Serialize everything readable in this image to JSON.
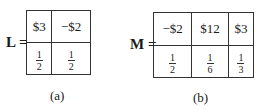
{
  "figure_a": {
    "label": "L =",
    "row1": [
      "$3",
      "−$2"
    ],
    "row2": [
      {
        "num": "1",
        "den": "2"
      },
      {
        "num": "1",
        "den": "2"
      }
    ],
    "caption": "(a)"
  },
  "figure_b": {
    "label": "M =",
    "row1": [
      "−$2",
      "$12",
      "$3"
    ],
    "row2": [
      {
        "num": "1",
        "den": "2"
      },
      {
        "num": "1",
        "den": "6"
      },
      {
        "num": "1",
        "den": "3"
      }
    ],
    "caption": "(b)"
  }
}
